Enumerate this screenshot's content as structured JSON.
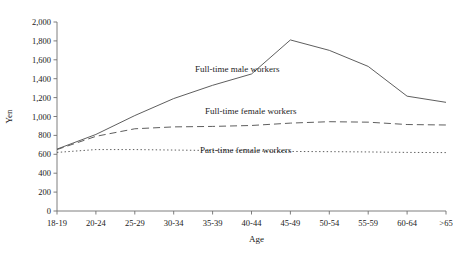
{
  "chart_data": {
    "type": "line",
    "title": "",
    "xlabel": "Age",
    "ylabel": "Yen",
    "categories": [
      "18-19",
      "20-24",
      "25-29",
      "30-34",
      "35-39",
      "40-44",
      "45-49",
      "50-54",
      "55-59",
      "60-64",
      ">65"
    ],
    "ylim": [
      0,
      2000
    ],
    "ytick_step": 200,
    "yticks": [
      "0",
      "200",
      "400",
      "600",
      "800",
      "1,000",
      "1,200",
      "1,400",
      "1,600",
      "1,800",
      "2,000"
    ],
    "grid": false,
    "legend_position": "inline-labels",
    "series": [
      {
        "name": "Full-time male workers",
        "style": "solid",
        "values": [
          655,
          810,
          1010,
          1190,
          1330,
          1450,
          1810,
          1700,
          1530,
          1215,
          1150
        ]
      },
      {
        "name": "Full-time female workers",
        "style": "dashed",
        "values": [
          650,
          790,
          870,
          890,
          895,
          905,
          930,
          945,
          940,
          915,
          910
        ]
      },
      {
        "name": "Part-time female workers",
        "style": "dotted",
        "values": [
          620,
          650,
          650,
          645,
          640,
          635,
          630,
          628,
          625,
          620,
          618
        ]
      }
    ],
    "annotations": [
      {
        "text": "Full-time male workers",
        "x": 195,
        "y": 72
      },
      {
        "text": "Full-time female workers",
        "x": 205,
        "y": 114
      },
      {
        "text": "Part-time female workers",
        "x": 200,
        "y": 153
      }
    ]
  },
  "axis": {
    "y_title": "Yen",
    "x_title": "Age"
  },
  "caption": {
    "text": ""
  },
  "colors": {
    "line": "#555555",
    "axis": "#6f6f6f",
    "text": "#1a1a1a"
  }
}
